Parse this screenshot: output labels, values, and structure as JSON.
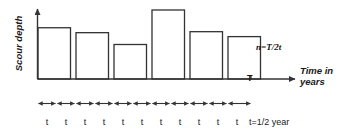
{
  "figure": {
    "y_axis_label": "Scour depth",
    "x_axis_label": "Time in years",
    "formula": "n=T/2t",
    "total_time_marker": "T",
    "interval_unit_label": "t=1/2 year",
    "interval_label": "t",
    "interval_count": 11,
    "stroke_color": "#333333",
    "text_color": "#1a1a1a"
  },
  "chart_data": {
    "type": "bar",
    "xlabel": "Time in years",
    "ylabel": "Scour depth",
    "categories": [
      "1",
      "2",
      "3",
      "4",
      "5",
      "6"
    ],
    "values": [
      52,
      47,
      35,
      70,
      48,
      43
    ],
    "ylim": [
      0,
      80
    ],
    "xlim": [
      0,
      12
    ],
    "grid": false,
    "legend": false,
    "annotations": [
      "n=T/2t",
      "T",
      "t=1/2 year"
    ],
    "bars": [
      {
        "index": 1,
        "x_start": 0,
        "x_end": 1.5,
        "height": 52
      },
      {
        "index": 2,
        "x_start": 2,
        "x_end": 3.5,
        "height": 47
      },
      {
        "index": 3,
        "x_start": 4,
        "x_end": 5.5,
        "height": 35
      },
      {
        "index": 4,
        "x_start": 6,
        "x_end": 7.5,
        "height": 70
      },
      {
        "index": 5,
        "x_start": 8,
        "x_end": 9.5,
        "height": 48
      },
      {
        "index": 6,
        "x_start": 10,
        "x_end": 11.5,
        "height": 43
      }
    ]
  },
  "tick_labels": [
    {
      "label": "t",
      "x": 47
    },
    {
      "label": "t",
      "x": 66
    },
    {
      "label": "t",
      "x": 85
    },
    {
      "label": "t",
      "x": 104
    },
    {
      "label": "t",
      "x": 123
    },
    {
      "label": "t",
      "x": 142
    },
    {
      "label": "t",
      "x": 161
    },
    {
      "label": "t",
      "x": 180
    },
    {
      "label": "t",
      "x": 199
    },
    {
      "label": "t",
      "x": 218
    },
    {
      "label": "t",
      "x": 237
    }
  ],
  "unit_label": {
    "label": "t=1/2 year",
    "x": 249
  }
}
